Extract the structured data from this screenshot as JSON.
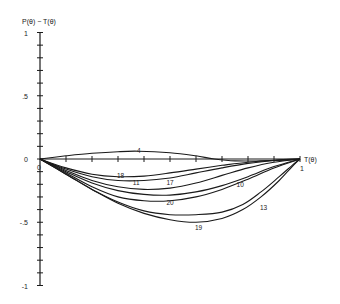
{
  "chart_data": {
    "type": "line",
    "title": "",
    "xlabel": "T(θ)",
    "ylabel": "P(θ) − T(θ)",
    "xlim": [
      0,
      1
    ],
    "ylim": [
      -1,
      1
    ],
    "x_tick_labels": [
      "0",
      "1"
    ],
    "y_tick_labels": [
      "1",
      ".5",
      "0",
      "-.5",
      "-1"
    ],
    "y_tick_values": [
      1,
      0.5,
      0,
      -0.5,
      -1
    ],
    "x_tick_step": 0.1,
    "y_minor_tick_step": 0.1,
    "grid": false,
    "legend": "none (curves labeled inline)",
    "colors": {
      "line": "#1a1a1a",
      "axis": "#1a1a1a",
      "background": "#ffffff"
    },
    "series": [
      {
        "name": "4",
        "label_pos": [
          0.38,
          0.07
        ],
        "x": [
          0,
          0.1,
          0.2,
          0.3,
          0.38,
          0.5,
          0.6,
          0.67,
          0.75,
          0.85,
          0.95,
          1
        ],
        "y": [
          0,
          0.025,
          0.045,
          0.058,
          0.062,
          0.05,
          0.025,
          0,
          -0.015,
          -0.015,
          -0.008,
          0
        ]
      },
      {
        "name": "18",
        "label_pos": [
          0.31,
          -0.125
        ],
        "x": [
          0,
          0.1,
          0.2,
          0.3,
          0.4,
          0.5,
          0.6,
          0.7,
          0.8,
          0.9,
          1
        ],
        "y": [
          0,
          -0.07,
          -0.12,
          -0.14,
          -0.135,
          -0.11,
          -0.08,
          -0.05,
          -0.025,
          -0.01,
          0
        ]
      },
      {
        "name": "11",
        "label_pos": [
          0.37,
          -0.18
        ],
        "x": [
          0,
          0.1,
          0.2,
          0.3,
          0.4,
          0.5,
          0.6,
          0.7,
          0.8,
          0.9,
          1
        ],
        "y": [
          0,
          -0.08,
          -0.14,
          -0.17,
          -0.17,
          -0.15,
          -0.11,
          -0.07,
          -0.035,
          -0.012,
          0
        ]
      },
      {
        "name": "17",
        "label_pos": [
          0.5,
          -0.18
        ],
        "x": [
          0,
          0.1,
          0.2,
          0.3,
          0.4,
          0.5,
          0.6,
          0.7,
          0.8,
          0.9,
          1
        ],
        "y": [
          0,
          -0.09,
          -0.17,
          -0.22,
          -0.24,
          -0.23,
          -0.19,
          -0.13,
          -0.07,
          -0.025,
          0
        ]
      },
      {
        "name": "10",
        "label_pos": [
          0.77,
          -0.2
        ],
        "x": [
          0,
          0.1,
          0.2,
          0.3,
          0.4,
          0.5,
          0.6,
          0.7,
          0.8,
          0.9,
          1
        ],
        "y": [
          0,
          -0.1,
          -0.19,
          -0.25,
          -0.28,
          -0.285,
          -0.26,
          -0.21,
          -0.14,
          -0.06,
          0
        ]
      },
      {
        "name": "20",
        "label_pos": [
          0.5,
          -0.34
        ],
        "x": [
          0,
          0.1,
          0.2,
          0.3,
          0.4,
          0.5,
          0.6,
          0.7,
          0.8,
          0.9,
          1
        ],
        "y": [
          0,
          -0.11,
          -0.22,
          -0.3,
          -0.33,
          -0.33,
          -0.3,
          -0.24,
          -0.16,
          -0.07,
          0
        ]
      },
      {
        "name": "13",
        "label_pos": [
          0.86,
          -0.38
        ],
        "x": [
          0,
          0.1,
          0.2,
          0.3,
          0.4,
          0.5,
          0.6,
          0.7,
          0.78,
          0.85,
          0.92,
          0.97,
          1
        ],
        "y": [
          0,
          -0.12,
          -0.24,
          -0.34,
          -0.41,
          -0.44,
          -0.44,
          -0.42,
          -0.36,
          -0.26,
          -0.14,
          -0.05,
          0
        ]
      },
      {
        "name": "19",
        "label_pos": [
          0.61,
          -0.54
        ],
        "x": [
          0,
          0.1,
          0.2,
          0.3,
          0.4,
          0.5,
          0.6,
          0.7,
          0.78,
          0.85,
          0.92,
          0.97,
          1
        ],
        "y": [
          0,
          -0.12,
          -0.24,
          -0.35,
          -0.43,
          -0.48,
          -0.5,
          -0.47,
          -0.4,
          -0.3,
          -0.17,
          -0.06,
          0
        ]
      }
    ]
  }
}
